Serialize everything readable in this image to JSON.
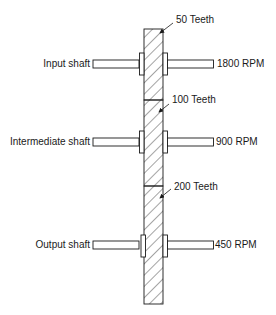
{
  "diagram": {
    "type": "compound gear train",
    "colors": {
      "line": "#1a1a1a",
      "background": "#ffffff"
    },
    "gears": [
      {
        "label": "50 Teeth"
      },
      {
        "label": "100 Teeth"
      },
      {
        "label": "200 Teeth"
      }
    ],
    "shafts": [
      {
        "name": "Input shaft",
        "speed": "1800 RPM"
      },
      {
        "name": "Intermediate shaft",
        "speed": "900 RPM"
      },
      {
        "name": "Output shaft",
        "speed": "450 RPM"
      }
    ]
  }
}
